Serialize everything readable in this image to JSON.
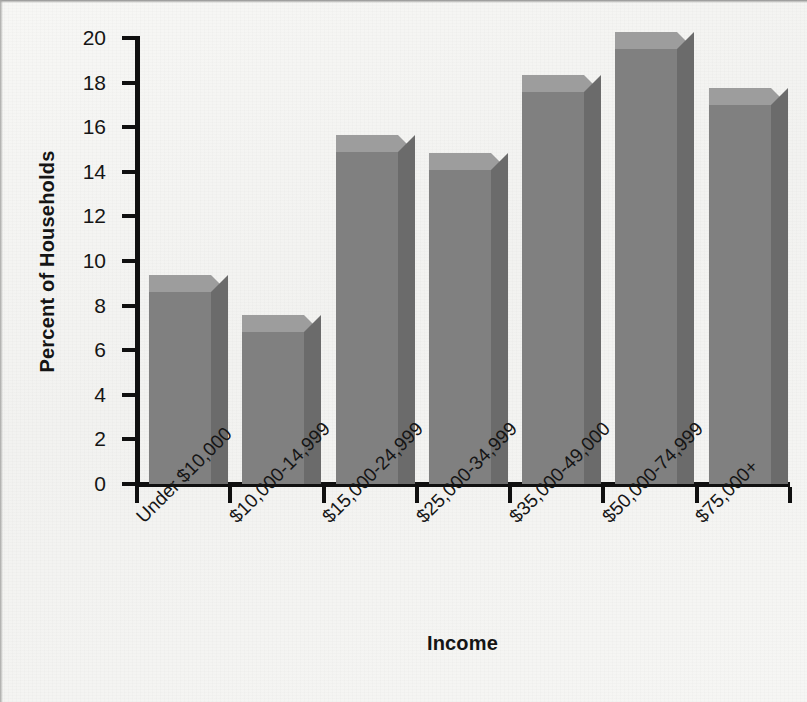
{
  "chart_data": {
    "type": "bar",
    "title": "",
    "subtitle": "",
    "xlabel": "Income",
    "ylabel": "Percent of Households",
    "categories": [
      "Under $10,000",
      "$10,000-14,999",
      "$15,000-24,999",
      "$25,000-34,999",
      "$35,000-49,000",
      "$50,000-74,999",
      "$75,000+"
    ],
    "values": [
      8.6,
      6.8,
      14.9,
      14.1,
      17.6,
      19.5,
      17.0
    ],
    "ylim": [
      0,
      20
    ],
    "ytick_labels": [
      "0",
      "2",
      "4",
      "6",
      "8",
      "10",
      "12",
      "14",
      "16",
      "18",
      "20"
    ],
    "ytick_values": [
      0,
      2,
      4,
      6,
      8,
      10,
      12,
      14,
      16,
      18,
      20
    ],
    "grid": false,
    "legend": false,
    "legend_position": "none",
    "style": "3d-bar",
    "bar_color": "#808080",
    "bar_top_color": "#9d9d9d",
    "bar_side_color": "#6b6b6b",
    "axis_color": "#101010",
    "background_color": "#f4f4f2",
    "xtick_label_rotation": -45
  },
  "axis": {
    "y_title": "Percent of Households",
    "x_title": "Income"
  }
}
